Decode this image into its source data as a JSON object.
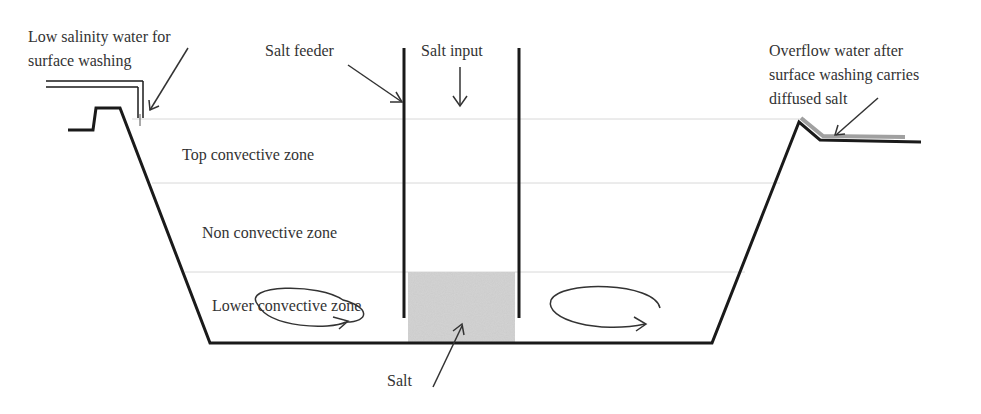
{
  "diagram": {
    "type": "salinity-gradient-solar-pond-cross-section",
    "colors": {
      "outline": "#1a1a1a",
      "zone_line": "#d8d8d8",
      "salt_fill": "#d4d4d4",
      "overflow": "#a0a0a0",
      "text": "#333333"
    },
    "labels": {
      "low_salinity_line1": "Low salinity water for",
      "low_salinity_line2": "surface washing",
      "salt_feeder": "Salt feeder",
      "salt_input": "Salt input",
      "overflow_line1": "Overflow water after",
      "overflow_line2": "surface washing carries",
      "overflow_line3": "diffused salt",
      "top_zone": "Top convective zone",
      "non_zone": "Non convective zone",
      "lower_zone": "Lower convective zone",
      "salt": "Salt"
    },
    "zones": [
      {
        "name": "Top convective zone"
      },
      {
        "name": "Non convective zone"
      },
      {
        "name": "Lower convective zone"
      }
    ]
  }
}
